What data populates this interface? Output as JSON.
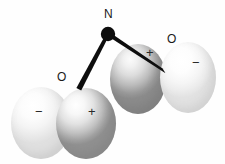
{
  "figure": {
    "background_color": "#fefefe",
    "width": 225,
    "height": 164
  },
  "atoms": {
    "nitrogen": {
      "label": "N",
      "label_x": 104,
      "label_y": 10,
      "center_x": 108,
      "center_y": 34,
      "radius": 7,
      "color": "#0d0d0d"
    },
    "oxygen_left": {
      "label": "O",
      "label_x": 58,
      "label_y": 71,
      "center_x": 78,
      "center_y": 89
    },
    "oxygen_right": {
      "label": "O",
      "label_x": 167,
      "label_y": 35,
      "center_x": 163,
      "center_y": 70
    }
  },
  "bonds": [
    {
      "name": "bond-n-o-left",
      "from_x": 108,
      "from_y": 34,
      "to_x": 79,
      "to_y": 89,
      "color": "#0d0d0d",
      "style": "tapered-wedge"
    },
    {
      "name": "bond-n-o-right",
      "from_x": 108,
      "from_y": 34,
      "to_x": 164,
      "to_y": 71,
      "color": "#0d0d0d",
      "style": "tapered-wedge"
    }
  ],
  "lobes": [
    {
      "name": "lobe-far-left",
      "sign": "−",
      "phase": "negative",
      "shade": "pale",
      "sign_x": 35,
      "sign_y": 112,
      "fill_light": "#ffffff",
      "fill_dark": "#e0e0e0"
    },
    {
      "name": "lobe-inner-left",
      "sign": "+",
      "phase": "positive",
      "shade": "mid-gray",
      "sign_x": 88,
      "sign_y": 112,
      "fill_light": "#ffffff",
      "fill_dark": "#919191"
    },
    {
      "name": "lobe-inner-right",
      "sign": "+",
      "phase": "positive",
      "shade": "dark-gray",
      "sign_x": 146,
      "sign_y": 51,
      "fill_light": "#fbfbfb",
      "fill_dark": "#8c8c8c"
    },
    {
      "name": "lobe-far-right",
      "sign": "−",
      "phase": "negative",
      "shade": "pale",
      "sign_x": 192,
      "sign_y": 61,
      "fill_light": "#ffffff",
      "fill_dark": "#e2e2e2"
    }
  ]
}
